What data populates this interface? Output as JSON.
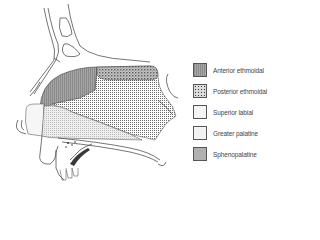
{
  "figure": {
    "regions": [
      {
        "id": "anterior-ethmoidal",
        "pattern": "vertical-hatch"
      },
      {
        "id": "posterior-ethmoidal",
        "pattern": "dense-speckle"
      },
      {
        "id": "superior-labial",
        "pattern": "plain"
      },
      {
        "id": "greater-palatine",
        "pattern": "fine-dots"
      },
      {
        "id": "sphenopalatine",
        "pattern": "cross-hatch-dots"
      }
    ]
  },
  "legend": {
    "items": [
      {
        "label": "Anterior ethmoidal",
        "swatch": "anterior"
      },
      {
        "label": "Posterior ethmoidal",
        "swatch": "posterior"
      },
      {
        "label": "Superior labial",
        "swatch": "superior"
      },
      {
        "label": "Greater palatine",
        "swatch": "greater"
      },
      {
        "label": "Sphenopalatine",
        "swatch": "spheno"
      }
    ]
  },
  "colors": {
    "line": "#3a3a3a",
    "anterior_fill": "#9a9a9a",
    "background": "#ffffff"
  }
}
